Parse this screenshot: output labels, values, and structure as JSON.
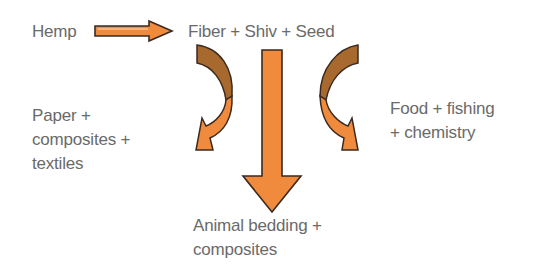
{
  "diagram": {
    "source": {
      "label": "Hemp"
    },
    "products": {
      "label": "Fiber + Shiv + Seed"
    },
    "outputs": {
      "left": {
        "lines": [
          "Paper +",
          "composites +",
          "textiles"
        ]
      },
      "center": {
        "lines": [
          "Animal bedding +",
          "composites"
        ]
      },
      "right": {
        "lines": [
          "Food + fishing",
          "+ chemistry"
        ]
      }
    },
    "arrows": [
      {
        "from": "Hemp",
        "to": "Fiber + Shiv + Seed",
        "direction": "right"
      },
      {
        "from": "Fiber",
        "to": "Paper + composites + textiles",
        "direction": "curved-down-left"
      },
      {
        "from": "Shiv",
        "to": "Animal bedding + composites",
        "direction": "down"
      },
      {
        "from": "Seed",
        "to": "Food + fishing + chemistry",
        "direction": "curved-down-right"
      }
    ],
    "colors": {
      "arrow_fill": "#f08a3c",
      "arrow_shadow": "#a8692e",
      "arrow_outline": "#3a2a20",
      "text": "#6a6a6a"
    }
  }
}
